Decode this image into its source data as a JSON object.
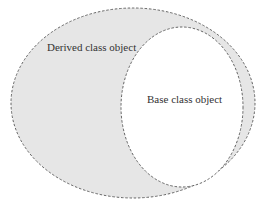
{
  "diagram": {
    "outer": {
      "label": "Derived class object",
      "fill": "#e6e6e6",
      "stroke": "#555555"
    },
    "inner": {
      "label": "Base class object",
      "fill": "#ffffff",
      "stroke": "#555555"
    }
  }
}
